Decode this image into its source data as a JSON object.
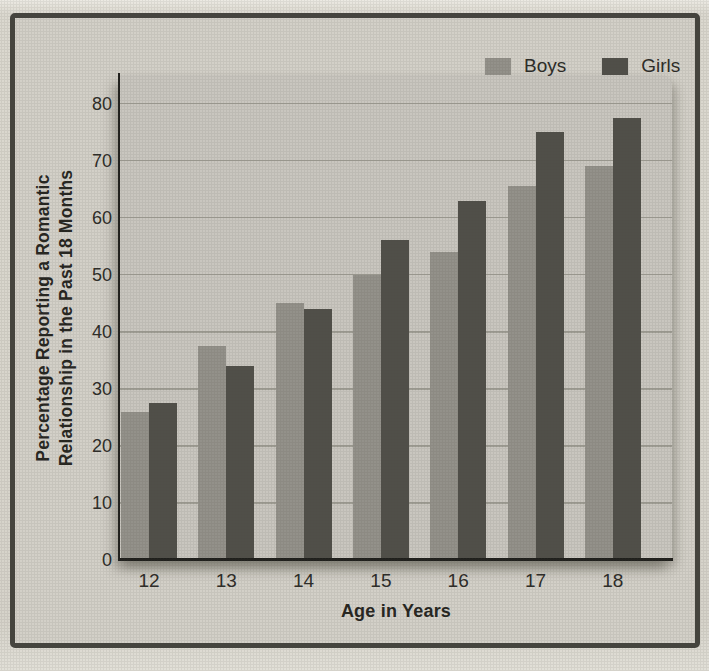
{
  "figure": {
    "kind": "scanned textbook bar chart",
    "colors": {
      "page_bg": "#d6d3ca",
      "box_bg": "#d3d0c8",
      "panel_bg": "#c9c6bf",
      "box_border": "#45443e",
      "gridline": "#a09e95",
      "axis_line": "#1f1f1c",
      "text": "#2c2b27"
    }
  },
  "legend": {
    "items": [
      {
        "label": "Boys",
        "color": "#93918a"
      },
      {
        "label": "Girls",
        "color": "#504f49"
      }
    ]
  },
  "chart_data": {
    "type": "bar",
    "title": "",
    "categories": [
      "12",
      "13",
      "14",
      "15",
      "16",
      "17",
      "18"
    ],
    "series": [
      {
        "name": "Boys",
        "color": "#93918a",
        "values": [
          26,
          37.5,
          45,
          50,
          54,
          65.5,
          69
        ]
      },
      {
        "name": "Girls",
        "color": "#504f49",
        "values": [
          27.5,
          34,
          44,
          56,
          63,
          75,
          77.5
        ]
      }
    ],
    "xlabel": "Age in Years",
    "ylabel": "Percentage Reporting a Romantic Relationship in the Past 18 Months",
    "ylabel_lines": [
      "Percentage Reporting a Romantic",
      "Relationship in the Past 18 Months"
    ],
    "ylim": [
      0,
      85
    ],
    "yticks": [
      0,
      10,
      20,
      30,
      40,
      50,
      60,
      70,
      80
    ],
    "grid": true,
    "legend_position": "top-right"
  }
}
